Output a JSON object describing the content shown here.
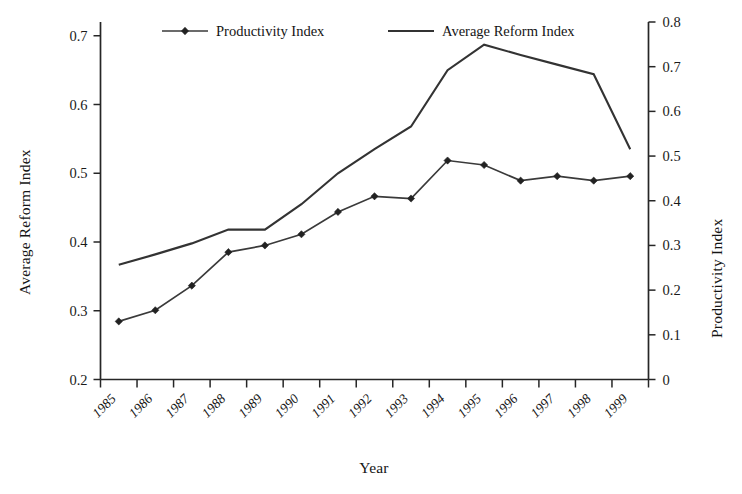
{
  "chart_data": {
    "type": "line",
    "title": "",
    "xlabel": "Year",
    "ylabel": "Average Reform Index",
    "y2label": "Productivity Index",
    "grid": false,
    "legend_position": "top-inside",
    "categories": [
      "1985",
      "1986",
      "1987",
      "1988",
      "1989",
      "1990",
      "1991",
      "1992",
      "1993",
      "1994",
      "1995",
      "1996",
      "1997",
      "1998",
      "1999"
    ],
    "x_tick_labels": [
      "1985",
      "1986",
      "1987",
      "1988",
      "1989",
      "1990",
      "1991",
      "1992",
      "1993",
      "1994",
      "1995",
      "1996",
      "1997",
      "1998",
      "1999"
    ],
    "ylim": [
      0.2,
      0.72
    ],
    "y_tick_labels": [
      "0.2",
      "0.3",
      "0.4",
      "0.5",
      "0.6",
      "0.7"
    ],
    "y_ticks": [
      0.2,
      0.3,
      0.4,
      0.5,
      0.6,
      0.7
    ],
    "y2lim": [
      0,
      0.8
    ],
    "y2_tick_labels": [
      "0",
      "0.1",
      "0.2",
      "0.3",
      "0.4",
      "0.5",
      "0.6",
      "0.7",
      "0.8"
    ],
    "y2_ticks": [
      0,
      0.1,
      0.2,
      0.3,
      0.4,
      0.5,
      0.6,
      0.7,
      0.8
    ],
    "series": [
      {
        "name": "Productivity Index",
        "axis": "right",
        "marker": "diamond",
        "color": "#333333",
        "values": [
          0.13,
          0.155,
          0.21,
          0.285,
          0.3,
          0.325,
          0.375,
          0.41,
          0.405,
          0.49,
          0.48,
          0.445,
          0.455,
          0.445,
          0.455
        ]
      },
      {
        "name": "Average Reform Index",
        "axis": "left",
        "marker": "none",
        "color": "#333333",
        "values": [
          0.367,
          0.382,
          0.398,
          0.418,
          0.418,
          0.455,
          0.5,
          0.535,
          0.568,
          0.65,
          0.687,
          0.672,
          0.658,
          0.644,
          0.535
        ]
      }
    ]
  },
  "legend": {
    "items": [
      {
        "label": "Productivity Index"
      },
      {
        "label": "Average Reform Index"
      }
    ]
  },
  "axes": {
    "left_title": "Average Reform Index",
    "right_title": "Productivity Index",
    "bottom_title": "Year"
  }
}
